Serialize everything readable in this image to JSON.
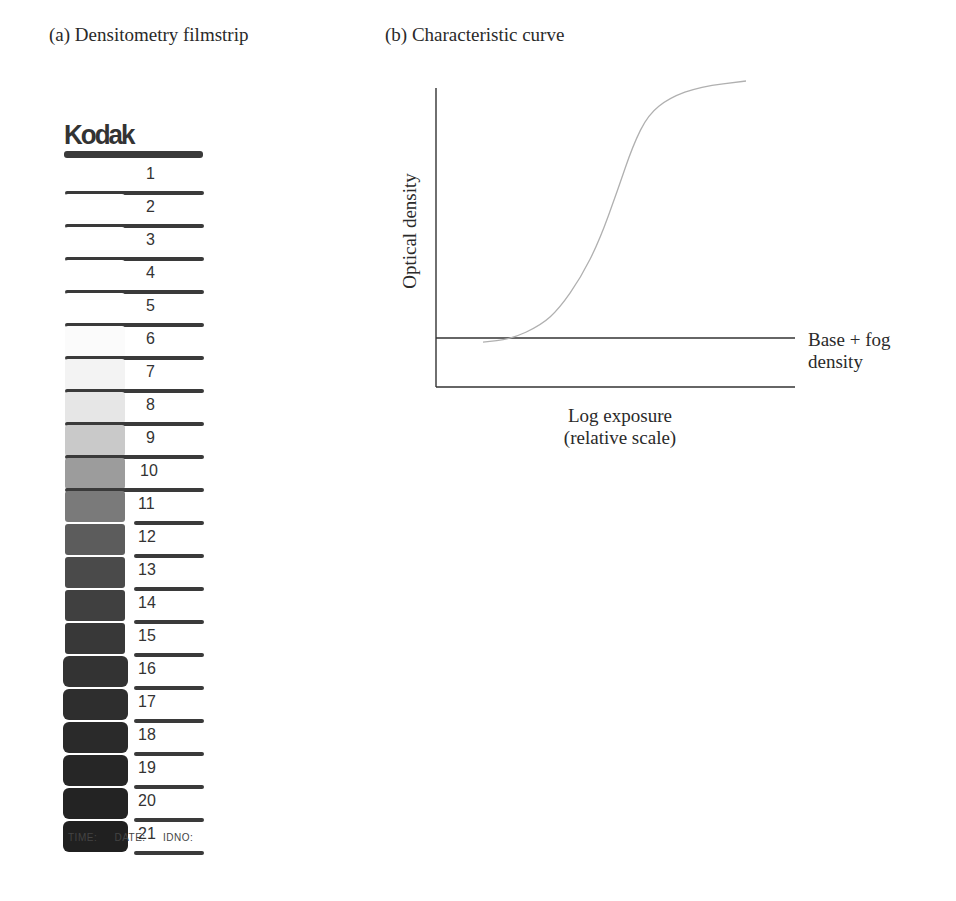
{
  "panels": {
    "a": {
      "title": "(a)  Densitometry filmstrip"
    },
    "b": {
      "title": "(b)  Characteristic curve"
    }
  },
  "filmstrip": {
    "brand": "Kodak",
    "steps": [
      {
        "n": "1",
        "shade": "#ffffff"
      },
      {
        "n": "2",
        "shade": "#ffffff"
      },
      {
        "n": "3",
        "shade": "#ffffff"
      },
      {
        "n": "4",
        "shade": "#ffffff"
      },
      {
        "n": "5",
        "shade": "#ffffff"
      },
      {
        "n": "6",
        "shade": "#fbfbfb"
      },
      {
        "n": "7",
        "shade": "#f3f3f3"
      },
      {
        "n": "8",
        "shade": "#e6e6e6"
      },
      {
        "n": "9",
        "shade": "#c9c9c9"
      },
      {
        "n": "10",
        "shade": "#9c9c9c"
      },
      {
        "n": "11",
        "shade": "#7a7a7a"
      },
      {
        "n": "12",
        "shade": "#5c5c5c"
      },
      {
        "n": "13",
        "shade": "#4a4a4a"
      },
      {
        "n": "14",
        "shade": "#404040"
      },
      {
        "n": "15",
        "shade": "#383838"
      },
      {
        "n": "16",
        "shade": "#333333"
      },
      {
        "n": "17",
        "shade": "#2e2e2e"
      },
      {
        "n": "18",
        "shade": "#2a2a2a"
      },
      {
        "n": "19",
        "shade": "#262626"
      },
      {
        "n": "20",
        "shade": "#232323"
      },
      {
        "n": "21",
        "shade": "#202020"
      }
    ],
    "footer": "TIME:  DATE:  IDNO:"
  },
  "chart_data": {
    "type": "line",
    "title": "(b) Characteristic curve",
    "xlabel": "Log exposure (relative scale)",
    "ylabel": "Optical density",
    "grid": false,
    "legend": null,
    "annotations": [
      "Base + fog density"
    ],
    "x": [
      0.0,
      0.09,
      0.19,
      0.25,
      0.32,
      0.38,
      0.44,
      0.49,
      0.54,
      0.61,
      0.71,
      0.86
    ],
    "series": [
      {
        "name": "Characteristic curve",
        "values": [
          0.16,
          0.17,
          0.22,
          0.28,
          0.39,
          0.52,
          0.7,
          0.86,
          0.97,
          1.03,
          1.07,
          1.09
        ]
      }
    ],
    "base_fog_level": 0.16,
    "xlim": [
      0,
      1
    ],
    "ylim": [
      0,
      1.1
    ]
  },
  "chart_labels": {
    "ylabel": "Optical density",
    "xlabel_line1": "Log exposure",
    "xlabel_line2": "(relative scale)",
    "base_line1": "Base + fog",
    "base_line2": "density"
  }
}
